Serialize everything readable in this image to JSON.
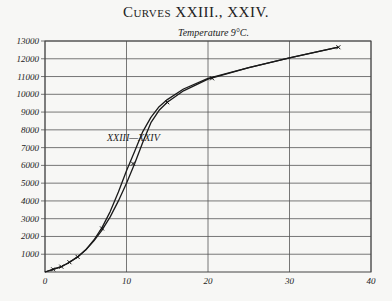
{
  "chart_data": {
    "type": "line",
    "title": "Curves XXIII., XXIV.",
    "subtitle": "Temperature 9°C.",
    "xlabel": "",
    "ylabel": "",
    "xlim": [
      0,
      40
    ],
    "ylim": [
      0,
      13000
    ],
    "x_ticks": [
      0,
      10,
      20,
      30,
      40
    ],
    "y_ticks": [
      1000,
      2000,
      3000,
      4000,
      5000,
      6000,
      7000,
      8000,
      9000,
      10000,
      11000,
      12000,
      13000
    ],
    "grid": true,
    "curve_label": "XXIII—XXIV",
    "series": [
      {
        "name": "XXIII",
        "x": [
          0,
          1,
          2,
          3,
          4,
          5,
          6,
          7,
          8,
          9,
          10,
          11,
          12,
          13,
          14,
          15,
          17,
          20,
          25,
          30,
          36
        ],
        "y": [
          0,
          150,
          300,
          550,
          850,
          1250,
          1800,
          2500,
          3400,
          4500,
          5700,
          6800,
          7900,
          8700,
          9300,
          9700,
          10300,
          10900,
          11500,
          12050,
          12650
        ]
      },
      {
        "name": "XXIV",
        "x": [
          0,
          1,
          2,
          3,
          4,
          5,
          6,
          7,
          8,
          9,
          10,
          11,
          12,
          13,
          14,
          15,
          17,
          20,
          25,
          30,
          36
        ],
        "y": [
          0,
          150,
          300,
          550,
          850,
          1250,
          1750,
          2350,
          3100,
          4000,
          5000,
          6100,
          7300,
          8400,
          9100,
          9550,
          10200,
          10850,
          11500,
          12050,
          12650
        ]
      }
    ],
    "markers": [
      {
        "x": 1,
        "y": 150
      },
      {
        "x": 2,
        "y": 300
      },
      {
        "x": 3,
        "y": 550
      },
      {
        "x": 4,
        "y": 850
      },
      {
        "x": 7,
        "y": 2450
      },
      {
        "x": 10.8,
        "y": 6100
      },
      {
        "x": 15,
        "y": 9550
      },
      {
        "x": 20.5,
        "y": 10900
      },
      {
        "x": 36,
        "y": 12650
      }
    ]
  }
}
